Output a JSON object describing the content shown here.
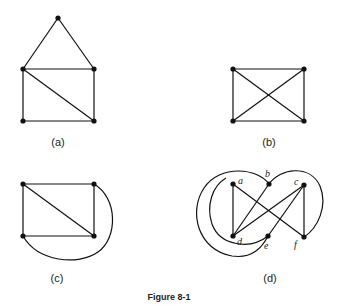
{
  "caption": "Figure 8-1",
  "panels": [
    {
      "label": "(a)"
    },
    {
      "label": "(b)"
    },
    {
      "label": "(c)"
    },
    {
      "label": "(d)"
    }
  ],
  "panel_d_vertices": {
    "a": "a",
    "b": "b",
    "c": "c",
    "d": "d",
    "e": "e",
    "f": "f"
  }
}
